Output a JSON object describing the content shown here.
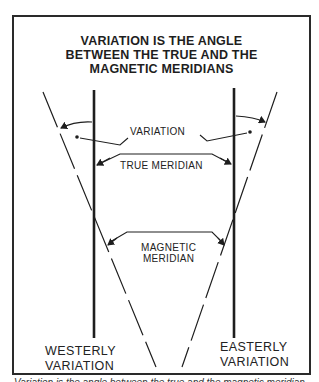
{
  "figure": {
    "title_lines": [
      "VARIATION IS THE ANGLE",
      "BETWEEN THE TRUE AND THE",
      "MAGNETIC MERIDIANS"
    ],
    "labels": {
      "variation": "VARIATION",
      "true_meridian": "TRUE MERIDIAN",
      "magnetic_meridian_line1": "MAGNETIC",
      "magnetic_meridian_line2": "MERIDIAN",
      "westerly_line1": "WESTERLY",
      "westerly_line2": "VARIATION",
      "easterly_line1": "EASTERLY",
      "easterly_line2": "VARIATION"
    },
    "caption_partial": "Variation is the angle between the true and the magnetic meridian"
  },
  "colors": {
    "ink": "#1e1e1e",
    "background": "#ffffff"
  }
}
